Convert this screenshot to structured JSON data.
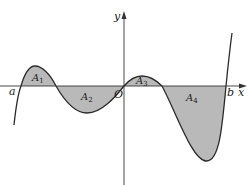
{
  "diagram": {
    "type": "function-graph-shaded-areas",
    "axes": {
      "x_label": "x",
      "y_label": "y",
      "origin_label": "O"
    },
    "interval": {
      "left_label": "a",
      "right_label": "b"
    },
    "regions": [
      {
        "id": "A1",
        "letter": "A",
        "subscript": "1",
        "position": "above x-axis"
      },
      {
        "id": "A2",
        "letter": "A",
        "subscript": "2",
        "position": "below x-axis"
      },
      {
        "id": "A3",
        "letter": "A",
        "subscript": "3",
        "position": "above x-axis"
      },
      {
        "id": "A4",
        "letter": "A",
        "subscript": "4",
        "position": "below x-axis"
      }
    ],
    "colors": {
      "fill": "#b9b9b9",
      "stroke": "#2a2a2a",
      "axis": "#333333",
      "background": "#ffffff"
    }
  }
}
